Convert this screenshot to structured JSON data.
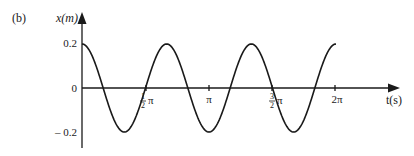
{
  "panel_label": "(b)",
  "colors": {
    "ink": "#1a1a1a",
    "background": "#ffffff"
  },
  "axes": {
    "y_label": "x(m)",
    "x_label": "t(s)",
    "y_ticks": [
      "0.2",
      "0",
      "– 0.2"
    ],
    "x_ticks": [
      {
        "num": "1",
        "den": "2",
        "sym": "π"
      },
      {
        "text": "π"
      },
      {
        "num": "3",
        "den": "2",
        "sym": "π"
      },
      {
        "text": "2π"
      }
    ]
  },
  "chart_data": {
    "type": "line",
    "title": "",
    "xlabel": "t(s)",
    "ylabel": "x(m)",
    "function": "x = 0.2 cos(3t)",
    "xlim": [
      0,
      6.283
    ],
    "ylim": [
      -0.2,
      0.2
    ],
    "x_tick_values": [
      1.571,
      3.142,
      4.712,
      6.283
    ],
    "x_tick_labels": [
      "½π",
      "π",
      "3/2π",
      "2π"
    ],
    "y_tick_values": [
      0.2,
      0,
      -0.2
    ],
    "y_tick_labels": [
      "0.2",
      "0",
      "-0.2"
    ],
    "series": [
      {
        "name": "x(t)",
        "x": [
          0,
          0.524,
          1.047,
          1.571,
          2.094,
          2.618,
          3.142,
          3.665,
          4.189,
          4.712,
          5.236,
          5.76,
          6.283
        ],
        "values": [
          0.2,
          0,
          -0.2,
          0,
          0.2,
          0,
          -0.2,
          0,
          0.2,
          0,
          -0.2,
          0,
          0.2
        ]
      }
    ],
    "grid": false,
    "legend": "none"
  }
}
